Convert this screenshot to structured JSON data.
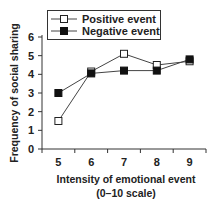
{
  "chart_data": {
    "type": "line",
    "title": "",
    "xlabel": "Intensity of emotional event\n(0–10 scale)",
    "xlabel_lines": [
      "Intensity of emotional event",
      "(0–10 scale)"
    ],
    "ylabel": "Frequency of social sharing",
    "categories": [
      "5",
      "6",
      "7",
      "8",
      "9"
    ],
    "x": [
      5,
      6,
      7,
      8,
      9
    ],
    "ylim": [
      0,
      6
    ],
    "yticks": [
      0,
      1,
      2,
      3,
      4,
      5,
      6
    ],
    "grid": false,
    "legend_position": "top-left",
    "series": [
      {
        "name": "Positive event",
        "marker": "open-square",
        "color": "#ffffff",
        "stroke": "#222222",
        "values": [
          1.5,
          4.15,
          5.1,
          4.5,
          4.7
        ]
      },
      {
        "name": "Negative event",
        "marker": "filled-square",
        "color": "#111111",
        "stroke": "#111111",
        "values": [
          3.0,
          4.05,
          4.2,
          4.2,
          4.8
        ]
      }
    ]
  }
}
